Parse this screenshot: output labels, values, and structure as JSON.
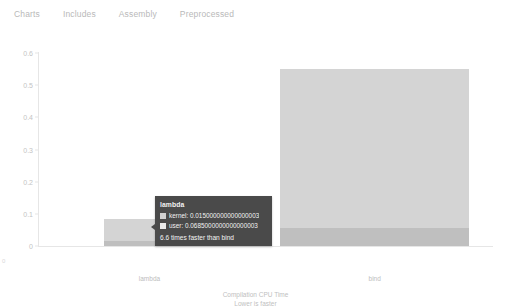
{
  "nav": {
    "items": [
      {
        "label": "Charts",
        "name": "nav-item-charts"
      },
      {
        "label": "Includes",
        "name": "nav-item-includes"
      },
      {
        "label": "Assembly",
        "name": "nav-item-assembly"
      },
      {
        "label": "Preprocessed",
        "name": "nav-item-preprocessed"
      }
    ]
  },
  "chart_data": {
    "type": "bar",
    "stacked": true,
    "title": "",
    "xlabel": "Compilation CPU Time",
    "xlabel_sub": "Lower is faster",
    "ylabel": "",
    "categories": [
      "lambda",
      "bind"
    ],
    "ylim": [
      0,
      0.6
    ],
    "yticks": [
      "0",
      "0.1",
      "0.2",
      "0.3",
      "0.4",
      "0.5",
      "0.6"
    ],
    "ytick_values": [
      0,
      0.1,
      0.2,
      0.3,
      0.4,
      0.5,
      0.6
    ],
    "grid": false,
    "legend_position": "none",
    "series": [
      {
        "name": "kernel",
        "values": [
          0.015,
          0.055
        ],
        "color": "#bfbfbf"
      },
      {
        "name": "user",
        "values": [
          0.0685,
          0.495
        ],
        "color": "#d4d4d4"
      }
    ],
    "totals": [
      0.0835,
      0.55
    ]
  },
  "tooltip": {
    "title": "lambda",
    "rows": [
      {
        "label": "kernel",
        "value": "0.015000000000000003",
        "text": "kernel: 0.015000000000000003",
        "swatch": "kernel"
      },
      {
        "label": "user",
        "value": "0.0685000000000000003",
        "text": "user: 0.0685000000000000003",
        "swatch": "user"
      }
    ],
    "footer": "6.6 times faster than bind"
  },
  "axis": {
    "title_line1": "Compilation CPU Time",
    "title_line2": "Lower is faster",
    "y_corner": "0"
  },
  "colors": {
    "bar_user": "#d4d4d4",
    "bar_kernel": "#bfbfbf",
    "tooltip_bg": "#4a4a4a",
    "nav_text": "#b9b9b9",
    "axis_text": "#c4c4c4"
  }
}
